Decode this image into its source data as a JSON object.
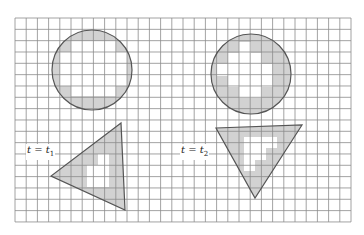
{
  "figure": {
    "grid": {
      "x": 15,
      "y": 18,
      "cols": 30,
      "rows": 18,
      "cell_w": 11.2,
      "cell_h": 11.33,
      "line_color": "#8a8a8a",
      "border_color": "#9a9a9a"
    },
    "colors": {
      "shape_fill": "#cfcfcf",
      "shape_stroke": "#555555",
      "interior": "#ffffff"
    },
    "panels": [
      {
        "label": {
          "var": "t",
          "eq": " = ",
          "time": "t",
          "subscript": "1"
        },
        "label_pos": {
          "x": 26,
          "y": 144
        },
        "circle": {
          "cx": 92,
          "cy": 70,
          "r": 40
        },
        "triangle": [
          [
            121,
            123
          ],
          [
            51,
            176
          ],
          [
            125,
            210
          ]
        ]
      },
      {
        "label": {
          "var": "t",
          "eq": " = ",
          "time": "t",
          "subscript": "2"
        },
        "label_pos": {
          "x": 180,
          "y": 144
        },
        "circle": {
          "cx": 251,
          "cy": 74,
          "r": 40
        },
        "triangle": [
          [
            216,
            128
          ],
          [
            302,
            125
          ],
          [
            255,
            198
          ]
        ]
      }
    ]
  }
}
